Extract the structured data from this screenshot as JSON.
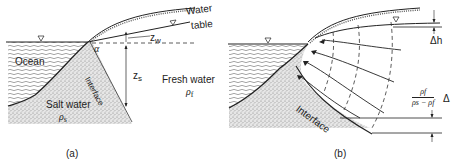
{
  "panel_a": {
    "caption": "(a)",
    "labels": {
      "water_table_line1": "Water",
      "water_table_line2": "table",
      "zw": "z",
      "zw_sub": "w",
      "alpha": "α",
      "ocean": "Ocean",
      "interface": "Interface",
      "zs": "z",
      "zs_sub": "s",
      "fresh_water": "Fresh water",
      "rho_f": "ρ",
      "rho_f_sub": "f",
      "salt_water": "Salt water",
      "rho_s": "ρ",
      "rho_s_sub": "s"
    },
    "symbols": {
      "water_level_marker": "▽"
    }
  },
  "panel_b": {
    "caption": "(b)",
    "labels": {
      "delta_h": "Δh",
      "interface": "Interface",
      "fraction_numerator": "ρf",
      "fraction_denominator": "ρs − ρf",
      "delta": "Δ"
    },
    "symbols": {
      "water_level_marker": "▽"
    }
  }
}
